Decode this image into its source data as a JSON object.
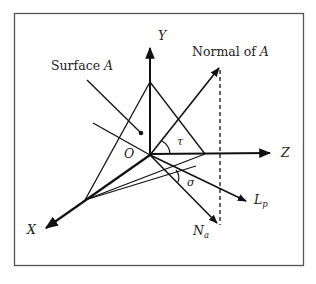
{
  "labels": {
    "surface": "Surface",
    "surface_var": "A",
    "normal": "Normal of",
    "normal_var": "A",
    "y_axis": "Y",
    "z_axis": "Z",
    "x_axis": "X",
    "origin": "O",
    "tau": "τ",
    "sigma": "σ",
    "lp_main": "L",
    "lp_sub": "p",
    "na_main": "N",
    "na_sub": "a"
  },
  "colors": {
    "stroke": "#111111",
    "frame": "#555555",
    "background": "#ffffff"
  }
}
